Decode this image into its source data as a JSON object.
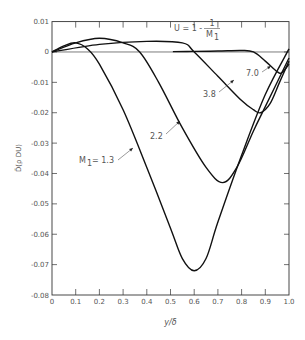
{
  "chart_data": {
    "type": "line",
    "title": "",
    "xlabel": "y/δ",
    "ylabel": "D̄(ρ DU)",
    "xlim": [
      0,
      1.0
    ],
    "ylim": [
      -0.08,
      0.01
    ],
    "grid": false,
    "legend": "none (curves labeled inline)",
    "x_ticks": [
      "0",
      "0.1",
      "0.2",
      "0.3",
      "0.4",
      "0.5",
      "0.6",
      "0.7",
      "0.8",
      "0.9",
      "1.0"
    ],
    "y_ticks": [
      "0.01",
      "0",
      "-0.01",
      "-0.02",
      "-0.03",
      "-0.04",
      "-0.05",
      "-0.06",
      "-0.07",
      "-0.08"
    ],
    "annotations": {
      "velocity_formula": "U = 1 - 1/M₁",
      "formula_lhs": "U = 1 -",
      "formula_num": "1",
      "formula_den": "M",
      "formula_den_sub": "1",
      "labels": [
        "M₁ = 1.3",
        "2.2",
        "3.8",
        "7.0"
      ]
    },
    "series": [
      {
        "name": "M1 = 1.3",
        "label": "M",
        "label_sub": "1",
        "label_rest": "= 1.3",
        "x": [
          0,
          0.05,
          0.1,
          0.15,
          0.2,
          0.3,
          0.4,
          0.5,
          0.55,
          0.6,
          0.65,
          0.7,
          0.8,
          0.9,
          1.0
        ],
        "y": [
          0,
          0.002,
          0.003,
          0.001,
          -0.004,
          -0.019,
          -0.038,
          -0.058,
          -0.068,
          -0.072,
          -0.068,
          -0.056,
          -0.034,
          -0.014,
          0.001
        ]
      },
      {
        "name": "M1 = 2.2",
        "label": "2.2",
        "x": [
          0,
          0.1,
          0.2,
          0.3,
          0.37,
          0.45,
          0.55,
          0.65,
          0.72,
          0.78,
          0.85,
          0.9,
          1.0
        ],
        "y": [
          0,
          0.003,
          0.0045,
          0.003,
          0,
          -0.01,
          -0.025,
          -0.038,
          -0.043,
          -0.038,
          -0.026,
          -0.018,
          -0.002
        ]
      },
      {
        "name": "M1 = 3.8",
        "label": "3.8",
        "x": [
          0,
          0.2,
          0.4,
          0.55,
          0.6,
          0.7,
          0.8,
          0.85,
          0.88,
          0.92,
          0.96,
          1.0
        ],
        "y": [
          0,
          0.0025,
          0.0035,
          0.003,
          0,
          -0.008,
          -0.016,
          -0.019,
          -0.02,
          -0.017,
          -0.01,
          -0.003
        ]
      },
      {
        "name": "M1 = 7.0",
        "label": "7.0",
        "x": [
          0.51,
          0.6,
          0.7,
          0.8,
          0.85,
          0.9,
          0.95,
          0.97,
          1.0
        ],
        "y": [
          0.0001,
          0.0002,
          0.0003,
          0.0005,
          0,
          -0.003,
          -0.0065,
          -0.0068,
          -0.004
        ]
      }
    ]
  }
}
